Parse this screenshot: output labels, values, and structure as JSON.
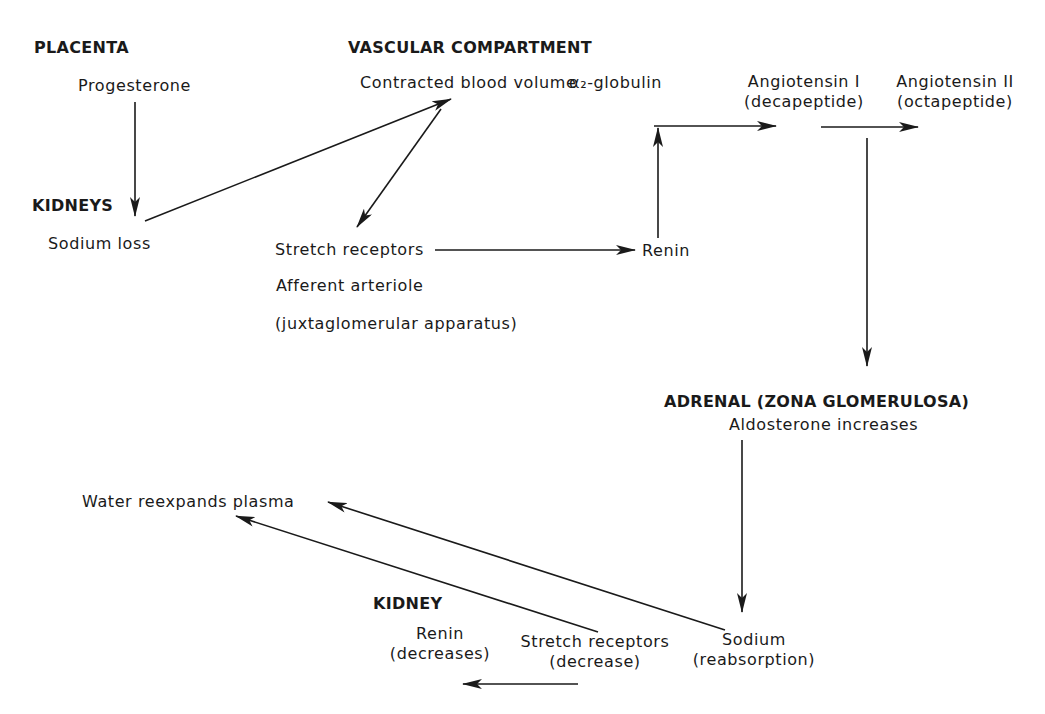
{
  "sections": {
    "placenta": "PLACENTA",
    "vascular": "VASCULAR COMPARTMENT",
    "kidneys": "KIDNEYS",
    "adrenal": "ADRENAL (ZONA GLOMERULOSA)",
    "kidney": "KIDNEY"
  },
  "nodes": {
    "progesterone": "Progesterone",
    "contracted_blood_volume": "Contracted blood volume",
    "alpha2_globulin": "α₂-globulin",
    "angiotensin1": "Angiotensin I",
    "angiotensin1_sub": "(decapeptide)",
    "angiotensin2": "Angiotensin II",
    "angiotensin2_sub": "(octapeptide)",
    "sodium_loss": "Sodium loss",
    "stretch_receptors": "Stretch receptors",
    "afferent_arteriole": "Afferent arteriole",
    "juxtaglomerular": "(juxtaglomerular apparatus)",
    "renin": "Renin",
    "aldosterone": "Aldosterone increases",
    "water_reexpands": "Water reexpands plasma",
    "renin_decreases": "Renin",
    "renin_decreases_sub": "(decreases)",
    "stretch_decrease": "Stretch receptors",
    "stretch_decrease_sub": "(decrease)",
    "sodium": "Sodium",
    "sodium_sub": "(reabsorption)"
  },
  "edges": [
    {
      "from": "progesterone",
      "to": "sodium_loss"
    },
    {
      "from": "sodium_loss",
      "to": "contracted_blood_volume"
    },
    {
      "from": "contracted_blood_volume",
      "to": "stretch_receptors"
    },
    {
      "from": "stretch_receptors",
      "to": "renin"
    },
    {
      "from": "renin",
      "to": "alpha2_globulin_conversion"
    },
    {
      "from": "alpha2_globulin",
      "to": "angiotensin1"
    },
    {
      "from": "angiotensin1",
      "to": "angiotensin2"
    },
    {
      "from": "angiotensin_conversion",
      "to": "adrenal"
    },
    {
      "from": "aldosterone",
      "to": "sodium"
    },
    {
      "from": "sodium",
      "to": "water_reexpands"
    },
    {
      "from": "stretch_decrease",
      "to": "water_reexpands"
    },
    {
      "from": "stretch_decrease",
      "to": "renin_decreases"
    }
  ],
  "colors": {
    "ink": "#1a1a1a",
    "background": "#ffffff"
  }
}
